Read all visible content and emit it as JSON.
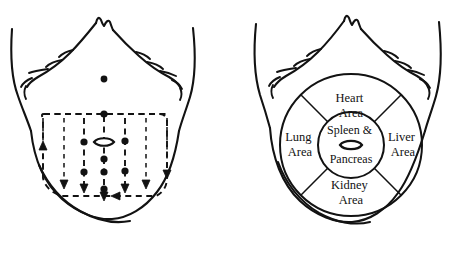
{
  "figure": {
    "background_color": "#ffffff",
    "ink_color": "#121212",
    "panels": [
      {
        "id": "left",
        "name": "palpation-direction-panel",
        "description": "Front torso with dashed palpation grid, direction arrows and pressure point dots"
      },
      {
        "id": "right",
        "name": "organ-zone-panel",
        "description": "Front torso with concentric circles mapping organ diagnostic zones"
      }
    ]
  },
  "zones": {
    "heart": {
      "line1": "Heart",
      "line2": "Area"
    },
    "lung": {
      "line1": "Lung",
      "line2": "Area"
    },
    "liver": {
      "line1": "Liver",
      "line2": "Area"
    },
    "kidney": {
      "line1": "Kidney",
      "line2": "Area"
    },
    "center": {
      "line1": "Spleen &",
      "line2": "Pancreas"
    }
  },
  "icons": {
    "navel": "navel-lens-icon",
    "arrow_down": "arrow-down-icon",
    "arrow_up": "arrow-up-icon",
    "arrow_left": "arrow-left-icon"
  }
}
